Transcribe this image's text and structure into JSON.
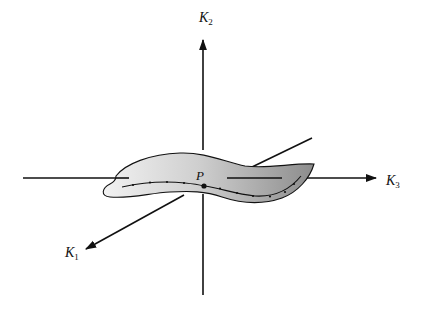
{
  "diagram": {
    "type": "3d-coordinate-axes-with-surface",
    "axes": {
      "k1": {
        "label": "K",
        "subscript": "1"
      },
      "k2": {
        "label": "K",
        "subscript": "2"
      },
      "k3": {
        "label": "K",
        "subscript": "3"
      }
    },
    "point": {
      "label": "P"
    },
    "surface": {
      "description": "curved shaded sheet passing through P with a dotted/ticked curve on it"
    },
    "colors": {
      "line": "#111111",
      "sheet_light": "#f0f0f0",
      "sheet_dark": "#8a8a8a",
      "background": "#ffffff"
    }
  }
}
